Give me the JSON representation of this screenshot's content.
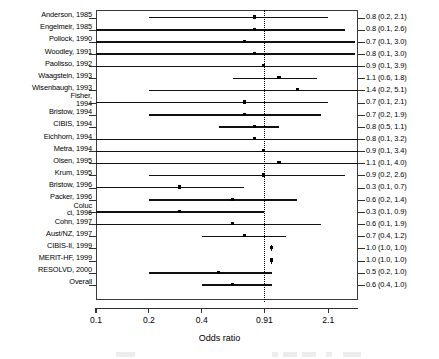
{
  "chart_data": {
    "type": "forest",
    "title": "",
    "xlabel": "Odds ratio",
    "ylabel": "",
    "xscale": "log",
    "xlim": [
      0.1,
      3.1
    ],
    "xticks": [
      0.1,
      0.2,
      0.4,
      0.91,
      2.1
    ],
    "xtick_labels": [
      "0.1",
      "0.2",
      "0.4",
      "0.91",
      "2.1"
    ],
    "reference_line": 0.91,
    "grid": false,
    "legend": "none",
    "categories": [
      "Anderson, 1985",
      "Engelmeir, 1985",
      "Pollock, 1990",
      "Woodley, 1991",
      "Paolisso, 1992",
      "Waagstein, 1993",
      "Wisenbaugh, 1993",
      "Fisher, 1994",
      "Bristow, 1994",
      "CIBIS, 1994",
      "Eichhorn, 1994",
      "Metra, 1994",
      "Olsen, 1995",
      "Krum, 1995",
      "Bristow, 1996",
      "Packer, 1996",
      "Colucci, 1996",
      "Cohn, 1997",
      "Aust/NZ, 1997",
      "CIBIS-II, 1999",
      "MERIT-HF, 1999",
      "RESOLVD, 2000",
      "Overall"
    ],
    "estimates": [
      0.8,
      0.8,
      0.7,
      0.8,
      0.9,
      1.1,
      1.4,
      0.7,
      0.7,
      0.8,
      0.8,
      0.9,
      1.1,
      0.9,
      0.3,
      0.6,
      0.3,
      0.6,
      0.7,
      1.0,
      1.0,
      0.5,
      0.6
    ],
    "ci_lower": [
      0.2,
      0.1,
      0.1,
      0.1,
      0.1,
      0.6,
      0.2,
      0.1,
      0.2,
      0.5,
      0.1,
      0.1,
      0.1,
      0.2,
      0.1,
      0.2,
      0.1,
      0.1,
      0.4,
      1.0,
      1.0,
      0.2,
      0.4
    ],
    "ci_upper": [
      2.1,
      2.6,
      3.0,
      3.0,
      3.9,
      1.8,
      5.1,
      2.1,
      1.9,
      1.1,
      3.2,
      3.4,
      4.0,
      2.6,
      0.7,
      1.4,
      0.9,
      1.9,
      1.2,
      1.0,
      1.0,
      1.0,
      1.0
    ],
    "value_labels": [
      "0.8 (0.2, 2.1)",
      "0.8 (0.1, 2.6)",
      "0.7 (0.1, 3.0)",
      "0.8 (0.1, 3.0)",
      "0.9 (0.1, 3.9)",
      "1.1 (0.6, 1.8)",
      "1.4 (0.2, 5.1)",
      "0.7 (0.1, 2.1)",
      "0.7 (0.2, 1.9)",
      "0.8 (0.5, 1.1)",
      "0.8 (0.1, 3.2)",
      "0.9 (0.1, 3.4)",
      "1.1 (0.1, 4.0)",
      "0.9 (0.2, 2.6)",
      "0.3 (0.1, 0.7)",
      "0.6 (0.2, 1.4)",
      "0.3 (0.1, 0.9)",
      "0.6 (0.1, 1.9)",
      "0.7 (0.4, 1.2)",
      "1.0 (1.0, 1.0)",
      "1.0 (1.0, 1.0)",
      "0.5 (0.2, 1.0)",
      "0.6 (0.4, 1.0)"
    ],
    "label_lines": [
      [
        "Anderson, 1985"
      ],
      [
        "Engelmeir, 1985"
      ],
      [
        "Pollock, 1990"
      ],
      [
        "Woodley, 1991"
      ],
      [
        "Paolisso, 1992"
      ],
      [
        "Waagstein, 1993"
      ],
      [
        "Wisenbaugh, 1993"
      ],
      [
        "Fisher,",
        "1994"
      ],
      [
        "Bristow, 1994"
      ],
      [
        "CIBIS, 1994"
      ],
      [
        "Eichhorn, 1994"
      ],
      [
        "Metra, 1994"
      ],
      [
        "Olsen, 1995"
      ],
      [
        "Krum, 1995"
      ],
      [
        "Bristow, 1996"
      ],
      [
        "Packer, 1996"
      ],
      [
        "Coluc",
        "ci, 1996"
      ],
      [
        "Cohn, 1997"
      ],
      [
        "Aust/NZ, 1997"
      ],
      [
        "CIBIS-II, 1999"
      ],
      [
        "MERIT-HF, 1999"
      ],
      [
        "RESOLVD, 2000"
      ],
      [
        "Overall"
      ]
    ]
  },
  "axis": {
    "x_title": "Odds ratio"
  }
}
